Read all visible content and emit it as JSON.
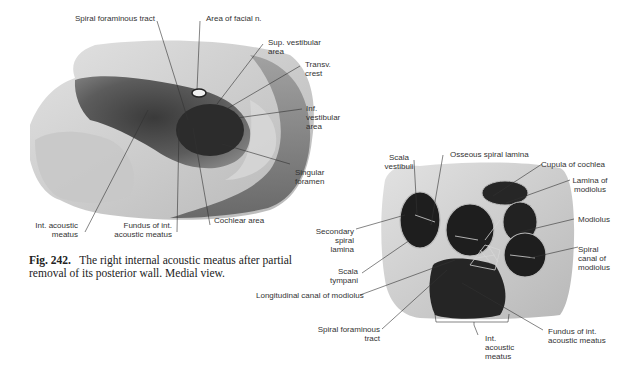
{
  "figure_242": {
    "caption_number": "Fig. 242.",
    "caption_text": "The right internal acoustic meatus after partial removal of its posterior wall. Medial view.",
    "labels": {
      "spiral_foraminous_tract": "Spiral foraminous tract",
      "area_facial_n": "Area of facial n.",
      "sup_vestibular_1": "Sup. vestibular",
      "sup_vestibular_2": "area",
      "transv_crest_1": "Transv.",
      "transv_crest_2": "crest",
      "inf_vestibular_1": "Inf.",
      "inf_vestibular_2": "vestibular",
      "inf_vestibular_3": "area",
      "singular_foramen_1": "Singular",
      "singular_foramen_2": "foramen",
      "int_acoustic_meatus_1": "Int. acoustic",
      "int_acoustic_meatus_2": "meatus",
      "fundus_1": "Fundus of int.",
      "fundus_2": "acoustic meatus",
      "cochlear_area": "Cochlear area"
    }
  },
  "figure_243": {
    "labels": {
      "scala_vestibuli_1": "Scala",
      "scala_vestibuli_2": "vestibuli",
      "osseous_spiral_lamina": "Osseous spiral lamina",
      "cupula_of_cochlea": "Cupula of cochlea",
      "lamina_modiolus_1": "Lamina of",
      "lamina_modiolus_2": "modiolus",
      "modiolus": "Modiolus",
      "secondary_spiral_lamina_1": "Secondary",
      "secondary_spiral_lamina_2": "spiral",
      "secondary_spiral_lamina_3": "lamina",
      "spiral_canal_1": "Spiral",
      "spiral_canal_2": "canal of",
      "spiral_canal_3": "modiolus",
      "scala_tympani_1": "Scala",
      "scala_tympani_2": "tympani",
      "longitudinal_canal": "Longitudinal canal of modiolus",
      "spiral_foraminous_1": "Spiral foraminous",
      "spiral_foraminous_2": "tract",
      "int_acoustic_1": "Int.",
      "int_acoustic_2": "acoustic",
      "int_acoustic_3": "meatus",
      "fundus_1": "Fundus of int.",
      "fundus_2": "acoustic meatus"
    }
  },
  "colors": {
    "background": "#ffffff",
    "bone_light": "#cfcfcf",
    "bone_mid": "#9a9a9a",
    "bone_dark": "#4a4a4a",
    "cavity": "#1e1e1e",
    "leader_line": "#333333",
    "text": "#333333"
  }
}
